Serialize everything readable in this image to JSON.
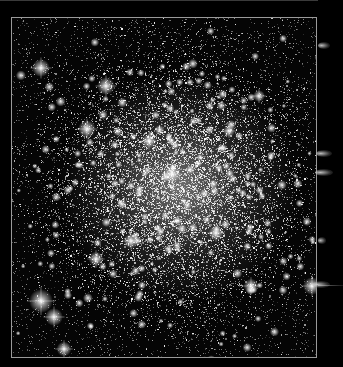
{
  "image": {
    "subject": "globular star cluster",
    "description": "Dense field of white stars concentrated toward a bright core, framed by a thin light-gray border on black background",
    "colors": {
      "background": "#000000",
      "frame": "#9a9a9a",
      "stars": "#ffffff",
      "core_glow": "#c8c8c8"
    },
    "frame": {
      "left": 11,
      "top": 17,
      "width": 306,
      "height": 341
    },
    "core_center": {
      "x": 175,
      "y": 185
    },
    "bright_stars": [
      {
        "x": 40,
        "y": 67,
        "r": 3
      },
      {
        "x": 105,
        "y": 85,
        "r": 3
      },
      {
        "x": 86,
        "y": 128,
        "r": 3
      },
      {
        "x": 40,
        "y": 300,
        "r": 4
      },
      {
        "x": 53,
        "y": 316,
        "r": 3
      },
      {
        "x": 63,
        "y": 348,
        "r": 2.5
      },
      {
        "x": 148,
        "y": 140,
        "r": 2.5
      },
      {
        "x": 171,
        "y": 173,
        "r": 3
      },
      {
        "x": 215,
        "y": 232,
        "r": 2.5
      },
      {
        "x": 250,
        "y": 285,
        "r": 2.5
      },
      {
        "x": 311,
        "y": 285,
        "r": 3
      },
      {
        "x": 228,
        "y": 130,
        "r": 2
      },
      {
        "x": 130,
        "y": 240,
        "r": 2.5
      },
      {
        "x": 95,
        "y": 258,
        "r": 2.5
      },
      {
        "x": 258,
        "y": 95,
        "r": 2
      }
    ],
    "edge_artifacts": [
      {
        "x": 318,
        "y": 45,
        "w": 12
      },
      {
        "x": 316,
        "y": 153,
        "w": 16
      },
      {
        "x": 315,
        "y": 172,
        "w": 18
      },
      {
        "x": 318,
        "y": 240,
        "w": 8
      },
      {
        "x": 312,
        "y": 284,
        "w": 18
      }
    ]
  }
}
